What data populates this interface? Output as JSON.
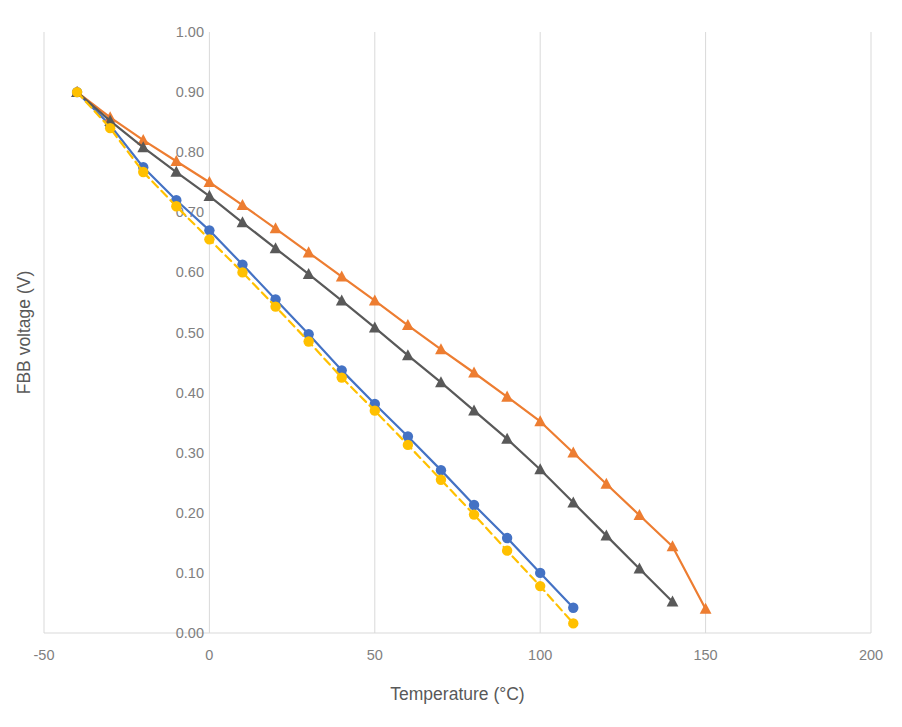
{
  "chart_data": {
    "type": "line",
    "title": "",
    "xlabel": "Temperature (°C)",
    "ylabel": "FBB voltage (V)",
    "xlim": [
      -50,
      200
    ],
    "ylim": [
      0.0,
      1.0
    ],
    "xticks": [
      -50,
      0,
      50,
      100,
      150,
      200
    ],
    "xtick_labels": [
      "-50",
      "0",
      "50",
      "100",
      "150",
      "200"
    ],
    "yticks": [
      0.0,
      0.1,
      0.2,
      0.3,
      0.4,
      0.5,
      0.6,
      0.7,
      0.8,
      0.9,
      1.0
    ],
    "ytick_labels": [
      "0.00",
      "0.10",
      "0.20",
      "0.30",
      "0.40",
      "0.50",
      "0.60",
      "0.70",
      "0.80",
      "0.90",
      "1.00"
    ],
    "grid": "vertical-only",
    "legend": "none",
    "colors": {
      "series_blue": "#4472C4",
      "series_orange": "#ED7D31",
      "series_gray": "#595959",
      "series_yellow": "#FFC000",
      "gridline": "#D9D9D9",
      "tick_text": "#7F7F7F",
      "axis_title": "#595959",
      "background": "#FFFFFF"
    },
    "series": [
      {
        "name": "series_blue",
        "color": "#4472C4",
        "marker": "circle",
        "linestyle": "solid",
        "x": [
          -40,
          -30,
          -20,
          -10,
          0,
          10,
          20,
          30,
          40,
          50,
          60,
          70,
          80,
          90,
          100,
          110
        ],
        "y": [
          0.9,
          0.845,
          0.775,
          0.72,
          0.67,
          0.613,
          0.555,
          0.497,
          0.437,
          0.381,
          0.327,
          0.271,
          0.213,
          0.158,
          0.1,
          0.042
        ]
      },
      {
        "name": "series_orange",
        "color": "#ED7D31",
        "marker": "triangle",
        "linestyle": "solid",
        "x": [
          -40,
          -30,
          -20,
          -10,
          0,
          10,
          20,
          30,
          40,
          50,
          60,
          70,
          80,
          90,
          100,
          110,
          120,
          130,
          140,
          150
        ],
        "y": [
          0.9,
          0.858,
          0.82,
          0.785,
          0.75,
          0.712,
          0.673,
          0.633,
          0.593,
          0.553,
          0.512,
          0.472,
          0.433,
          0.393,
          0.352,
          0.3,
          0.248,
          0.196,
          0.144,
          0.04
        ]
      },
      {
        "name": "series_gray",
        "color": "#595959",
        "marker": "triangle",
        "linestyle": "solid",
        "x": [
          -40,
          -30,
          -20,
          -10,
          0,
          10,
          20,
          30,
          40,
          50,
          60,
          70,
          80,
          90,
          100,
          110,
          120,
          130,
          140
        ],
        "y": [
          0.9,
          0.852,
          0.808,
          0.767,
          0.727,
          0.683,
          0.64,
          0.597,
          0.553,
          0.508,
          0.462,
          0.417,
          0.37,
          0.323,
          0.272,
          0.217,
          0.162,
          0.107,
          0.052
        ]
      },
      {
        "name": "series_yellow",
        "color": "#FFC000",
        "marker": "circle",
        "linestyle": "dashed",
        "x": [
          -40,
          -30,
          -20,
          -10,
          0,
          10,
          20,
          30,
          40,
          50,
          60,
          70,
          80,
          90,
          100,
          110
        ],
        "y": [
          0.9,
          0.84,
          0.767,
          0.71,
          0.655,
          0.6,
          0.543,
          0.485,
          0.425,
          0.37,
          0.313,
          0.255,
          0.197,
          0.137,
          0.078,
          0.016
        ]
      }
    ]
  }
}
